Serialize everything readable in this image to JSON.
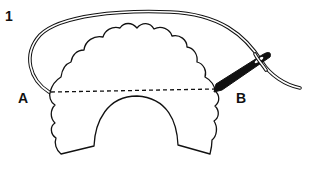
{
  "diagram": {
    "step_number": "1",
    "point_a_label": "A",
    "point_b_label": "B",
    "colors": {
      "line": "#111111",
      "background": "#ffffff"
    },
    "elements": [
      "scalloped-fabric-piece",
      "dashed-stitch-line",
      "thread-loop",
      "needle"
    ]
  }
}
